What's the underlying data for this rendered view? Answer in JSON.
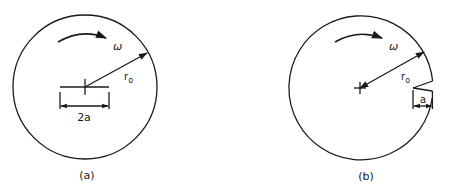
{
  "figures": [
    {
      "id": "a",
      "caption": "(a)",
      "description": "Rotating disk with central crack of length 2a",
      "labels": {
        "omega": "ω",
        "radius": "r",
        "radius_sub": "o",
        "crack_length": "2a"
      }
    },
    {
      "id": "b",
      "caption": "(b)",
      "description": "Rotating disk with edge crack of length a",
      "labels": {
        "omega": "ω",
        "radius": "r",
        "radius_sub": "o",
        "crack_length": "a"
      }
    }
  ],
  "colors": {
    "line": "#1a1a1a",
    "background": "#ffffff"
  }
}
